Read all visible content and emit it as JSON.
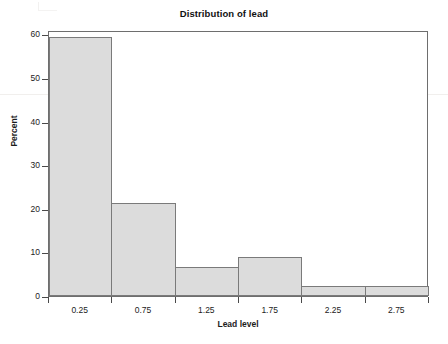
{
  "chart_data": {
    "type": "bar",
    "title": "Distribution of lead",
    "subtitle": "",
    "xlabel": "Lead level",
    "ylabel": "Percent",
    "categories": [
      "0.25",
      "0.75",
      "1.25",
      "1.75",
      "2.25",
      "2.75"
    ],
    "bin_edges": [
      0,
      0.5,
      1.0,
      1.5,
      2.0,
      2.5,
      3.0
    ],
    "values": [
      59.5,
      21.4,
      6.7,
      9.0,
      2.4,
      2.4
    ],
    "xtick_labels": [
      "0.25",
      "0.75",
      "1.25",
      "1.75",
      "2.25",
      "2.75"
    ],
    "ytick_labels": [
      "0",
      "10",
      "20",
      "30",
      "40",
      "50",
      "60"
    ],
    "ytick_values": [
      0,
      10,
      20,
      30,
      40,
      50,
      60
    ],
    "ylim": [
      0,
      61
    ],
    "xlim": [
      0,
      3
    ],
    "grid": false,
    "legend": false,
    "legend_position": "none",
    "bar_fill_color": "#dcdcdc",
    "bar_edge_color": "#7a7a7a",
    "frame_color": "#6e6e6e",
    "text_color": "#1c1c1c"
  }
}
